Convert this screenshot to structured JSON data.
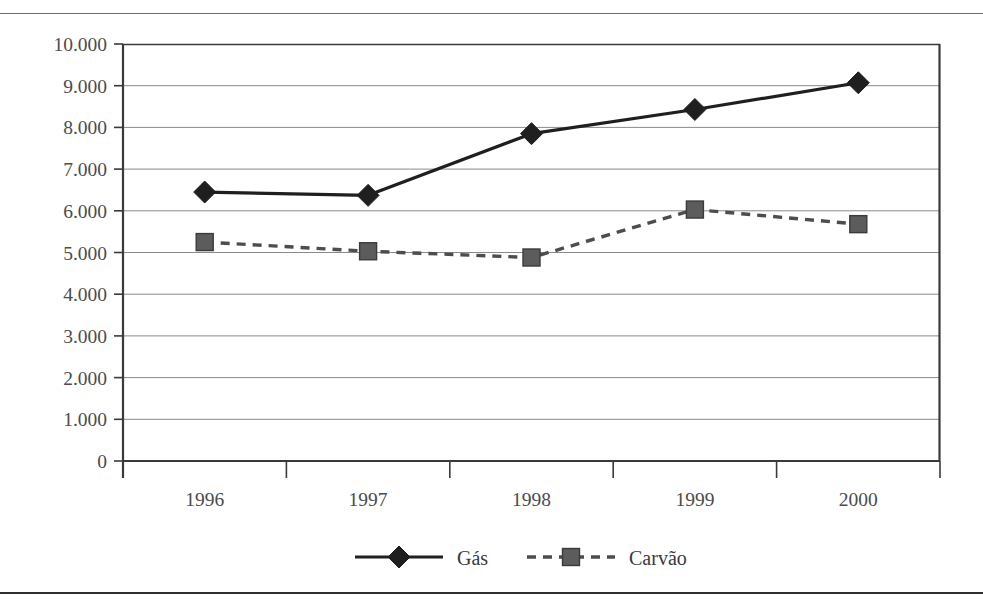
{
  "figure": {
    "title": "",
    "has_top_rule": true,
    "has_bottom_rule": true
  },
  "chart_data": {
    "type": "line",
    "title": "",
    "xlabel": "",
    "ylabel": "",
    "categories": [
      "1996",
      "1997",
      "1998",
      "1999",
      "2000"
    ],
    "ylim": [
      0,
      10000
    ],
    "ytick_values": [
      0,
      1000,
      2000,
      3000,
      4000,
      5000,
      6000,
      7000,
      8000,
      9000,
      10000
    ],
    "ytick_labels": [
      "0",
      "1.000",
      "2.000",
      "3.000",
      "4.000",
      "5.000",
      "6.000",
      "7.000",
      "8.000",
      "9.000",
      "10.000"
    ],
    "grid": true,
    "grid_axis": "y",
    "legend_position": "bottom-center",
    "series": [
      {
        "name": "Gás",
        "values": [
          6450,
          6370,
          7850,
          8430,
          9070
        ],
        "line_style": "solid",
        "marker": "diamond",
        "color": "#1f1f1f",
        "marker_color": "#1f1f1f"
      },
      {
        "name": "Carvão",
        "values": [
          5250,
          5030,
          4880,
          6030,
          5680
        ],
        "line_style": "dashed",
        "marker": "square",
        "color": "#4d4d4d",
        "marker_color": "#5c5c5c"
      }
    ]
  },
  "legend": {
    "items": [
      {
        "label": "Gás",
        "marker": "diamond-marker",
        "style": "solid"
      },
      {
        "label": "Carvão",
        "marker": "square-marker",
        "style": "dashed"
      }
    ]
  },
  "axes": {
    "y_axis_name": "value-axis",
    "x_axis_name": "year-axis"
  },
  "colors": {
    "axis": "#3a3a3a",
    "grid": "#8a8a8a",
    "gas": "#1f1f1f",
    "carvao": "#5c5c5c",
    "text": "#4b4b4b",
    "rule": "#2e2e2e"
  }
}
